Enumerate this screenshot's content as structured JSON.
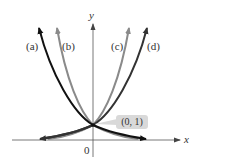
{
  "diagram": {
    "axes": {
      "x_label": "x",
      "y_label": "y",
      "origin_label": "0"
    },
    "curves": [
      {
        "id": "a",
        "label": "(a)",
        "color": "#111111",
        "behavior": "decreasing exponential"
      },
      {
        "id": "b",
        "label": "(b)",
        "color": "#8a8a8a",
        "behavior": "decreasing exponential (steeper)"
      },
      {
        "id": "c",
        "label": "(c)",
        "color": "#8a8a8a",
        "behavior": "increasing exponential (steeper)"
      },
      {
        "id": "d",
        "label": "(d)",
        "color": "#333333",
        "behavior": "increasing exponential"
      }
    ],
    "intersection": {
      "label": "(0, 1)",
      "callout_bg": "#d9d9d9"
    }
  }
}
